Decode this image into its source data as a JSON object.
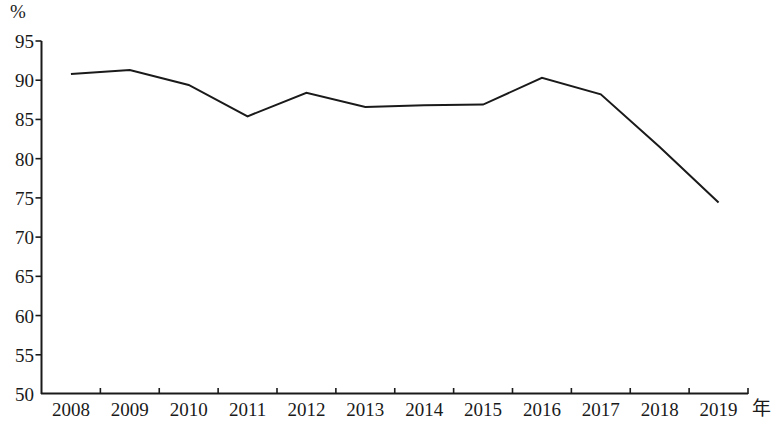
{
  "chart_data": {
    "type": "line",
    "title": "",
    "subtitle": "",
    "xlabel": "年",
    "ylabel": "%",
    "categories": [
      "2008",
      "2009",
      "2010",
      "2011",
      "2012",
      "2013",
      "2014",
      "2015",
      "2016",
      "2017",
      "2018",
      "2019"
    ],
    "x": [
      2008,
      2009,
      2010,
      2011,
      2012,
      2013,
      2014,
      2015,
      2016,
      2017,
      2018,
      2019
    ],
    "values": [
      90.8,
      91.3,
      89.4,
      85.4,
      88.4,
      86.6,
      86.8,
      86.9,
      90.3,
      88.2,
      81.5,
      74.4
    ],
    "series": [
      {
        "name": "",
        "values": [
          90.8,
          91.3,
          89.4,
          85.4,
          88.4,
          86.6,
          86.8,
          86.9,
          90.3,
          88.2,
          81.5,
          74.4
        ],
        "color": "#1a1a1a"
      }
    ],
    "ylim": [
      50,
      95
    ],
    "yticks": [
      50,
      55,
      60,
      65,
      70,
      75,
      80,
      85,
      90,
      95
    ],
    "ytick_labels": [
      "50",
      "55",
      "60",
      "65",
      "70",
      "75",
      "80",
      "85",
      "90",
      "95"
    ],
    "xtick_labels": [
      "2008",
      "2009",
      "2010",
      "2011",
      "2012",
      "2013",
      "2014",
      "2015",
      "2016",
      "2017",
      "2018",
      "2019"
    ],
    "grid": false,
    "legend": false,
    "legend_position": "none",
    "line_color": "#1a1a1a",
    "line_width": 2,
    "markers": false,
    "annotations": []
  },
  "axes": {
    "unit_label": "%",
    "x_axis_title": "年"
  }
}
